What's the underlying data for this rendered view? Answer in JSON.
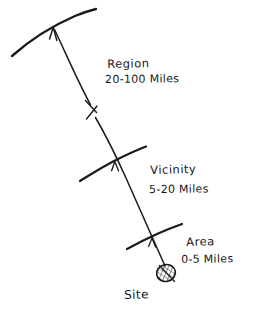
{
  "diagram": {
    "background_color": "#ffffff",
    "ink_color": "#1a1a1a",
    "zones": [
      {
        "id": "region",
        "name": "Region",
        "range": "20-100 Miles",
        "range_min_miles": 20,
        "range_max_miles": 100,
        "arc_label": "region-boundary-arc"
      },
      {
        "id": "vicinity",
        "name": "Vicinity",
        "range": "5-20 Miles",
        "range_min_miles": 5,
        "range_max_miles": 20,
        "arc_label": "vicinity-boundary-arc"
      },
      {
        "id": "area",
        "name": "Area",
        "range": "0-5 Miles",
        "range_min_miles": 0,
        "range_max_miles": 5,
        "arc_label": "area-boundary-arc"
      }
    ],
    "origin": {
      "id": "site",
      "name": "Site",
      "marker": "hatched-circle"
    },
    "annotations": {
      "distance_arrow": "arrow-pointing-outward-from-site",
      "break_mark": "line-break-symbol"
    }
  }
}
